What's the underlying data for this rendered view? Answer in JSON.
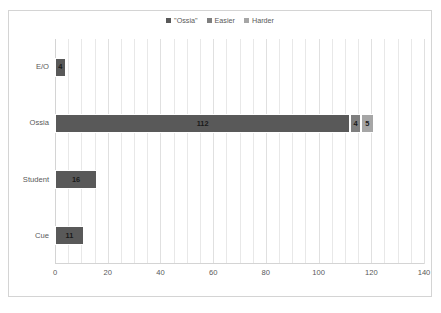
{
  "chart_data": {
    "type": "bar",
    "orientation": "horizontal",
    "stacked": true,
    "title": "",
    "subtitle": "",
    "xlabel": "",
    "ylabel": "",
    "categories": [
      "E/O",
      "Ossia",
      "Student",
      "Cue"
    ],
    "series": [
      {
        "name": "\"Ossia\"",
        "color": "#595959",
        "values": [
          4,
          112,
          16,
          11
        ]
      },
      {
        "name": "Easier",
        "color": "#7f7f7f",
        "values": [
          null,
          4,
          null,
          null
        ]
      },
      {
        "name": "Harder",
        "color": "#a6a6a6",
        "values": [
          null,
          5,
          null,
          null
        ]
      }
    ],
    "bar_labels": [
      {
        "category": "E/O",
        "segments": [
          {
            "series": "\"Ossia\"",
            "label": "4",
            "value": 4
          }
        ]
      },
      {
        "category": "Ossia",
        "segments": [
          {
            "series": "\"Ossia\"",
            "label": "112",
            "value": 112
          },
          {
            "series": "Easier",
            "label": "4",
            "value": 4
          },
          {
            "series": "Harder",
            "label": "5",
            "value": 5
          }
        ]
      },
      {
        "category": "Student",
        "segments": [
          {
            "series": "\"Ossia\"",
            "label": "16",
            "value": 16
          }
        ]
      },
      {
        "category": "Cue",
        "segments": [
          {
            "series": "\"Ossia\"",
            "label": "11",
            "value": 11
          }
        ]
      }
    ],
    "xlim": [
      0,
      140
    ],
    "xticks": [
      0,
      20,
      40,
      60,
      80,
      100,
      120,
      140
    ],
    "xtick_labels": [
      "0",
      "20",
      "40",
      "60",
      "80",
      "100",
      "120",
      "140"
    ],
    "minor_gridline_step": 5,
    "grid": true,
    "grid_axis": "x",
    "legend_position": "top-center"
  },
  "legend": {
    "entries": [
      {
        "label": "\"Ossia\"",
        "color": "#595959"
      },
      {
        "label": "Easier",
        "color": "#7f7f7f"
      },
      {
        "label": "Harder",
        "color": "#a6a6a6"
      }
    ]
  },
  "axes": {
    "y_categories": [
      "E/O",
      "Ossia",
      "Student",
      "Cue"
    ],
    "x_tick_labels": [
      "0",
      "20",
      "40",
      "60",
      "80",
      "100",
      "120",
      "140"
    ]
  },
  "caption": {
    "text": ""
  },
  "colors": {
    "frame_border": "#d4d4d4",
    "gridline": "#e8e8e8",
    "text": "#595959",
    "value_text": "#1a1a1a",
    "background": "#ffffff"
  }
}
